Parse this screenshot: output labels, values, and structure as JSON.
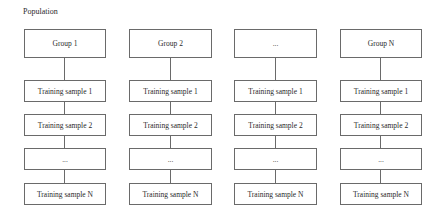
{
  "title": "Population",
  "columns": [
    {
      "group": "Group 1",
      "samples": [
        "Training sample 1",
        "Training sample 2",
        "...",
        "Training sample N"
      ]
    },
    {
      "group": "Group 2",
      "samples": [
        "Training sample 1",
        "Training sample 2",
        "...",
        "Training sample N"
      ]
    },
    {
      "group": "...",
      "samples": [
        "Training sample 1",
        "Training sample 2",
        "...",
        "Training sample N"
      ]
    },
    {
      "group": "Group N",
      "samples": [
        "Training sample 1",
        "Training sample 2",
        "...",
        "Training sample N"
      ]
    }
  ],
  "colors": {
    "border": "#6a6a6a",
    "text": "#2a2a2a",
    "background": "#ffffff"
  }
}
